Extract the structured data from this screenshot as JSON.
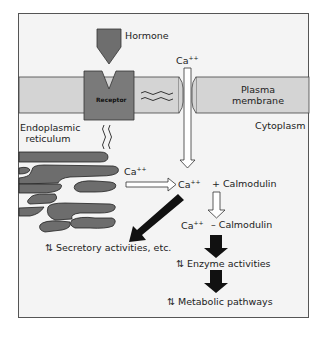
{
  "labels": {
    "hormone": "Hormone",
    "receptor": "Receptor",
    "ca_outside": "Ca",
    "ca_charge": "++",
    "plasma_membrane_line1": "Plasma",
    "plasma_membrane_line2": "membrane",
    "endoplasmic_line1": "Endoplasmic",
    "endoplasmic_line2": "reticulum",
    "cytoplasm": "Cytoplasm",
    "ca_er": "Ca",
    "ca_cyto": "Ca",
    "plus_calmodulin": "+  Calmodulin",
    "ca_complex": "Ca",
    "dash_calmodulin": "–  Calmodulin",
    "secretory": "⇅ Secretory activities, etc.",
    "enzyme": "⇅ Enzyme activities",
    "metabolic": "⇅ Metabolic pathways"
  },
  "colors": {
    "background": "#f4f4f4",
    "membrane": "#d4d4d4",
    "receptor": "#7a7a7a",
    "hormone": "#6e6e6e",
    "er": "#6d6d6d",
    "arrow_black": "#111111",
    "outline": "#333333"
  }
}
